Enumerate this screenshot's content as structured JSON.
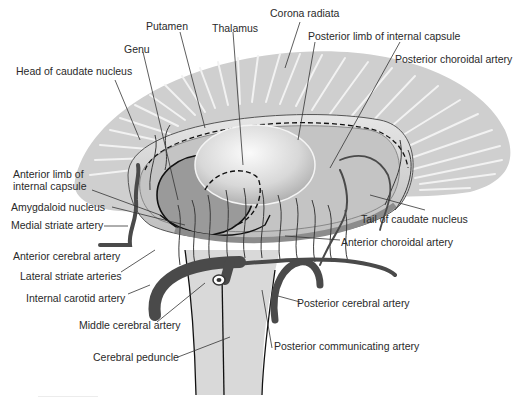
{
  "figure": {
    "colors": {
      "corona_fill": "#cfcfcf",
      "corona_streak": "#f2f2f2",
      "peduncle_fill": "#d9d9d9",
      "artery": "#4a4a4a",
      "leader_line": "#333333",
      "text": "#2a2a2a"
    }
  },
  "labels": {
    "putamen": "Putamen",
    "thalamus": "Thalamus",
    "corona_radiata": "Corona radiata",
    "genu": "Genu",
    "posterior_limb": "Posterior limb of internal capsule",
    "head_caudate": "Head of caudate nucleus",
    "posterior_choroidal": "Posterior choroidal artery",
    "anterior_limb": "Anterior limb of internal capsule",
    "amygdaloid": "Amygdaloid nucleus",
    "medial_striate": "Medial striate artery",
    "tail_caudate": "Tail of caudate nucleus",
    "anterior_cerebral": "Anterior cerebral artery",
    "anterior_choroidal": "Anterior choroidal artery",
    "lateral_striate": "Lateral striate arteries",
    "internal_carotid": "Internal carotid artery",
    "posterior_cerebral": "Posterior cerebral artery",
    "middle_cerebral": "Middle cerebral artery",
    "cerebral_peduncle": "Cerebral peduncle",
    "posterior_communicating": "Posterior communicating artery"
  }
}
